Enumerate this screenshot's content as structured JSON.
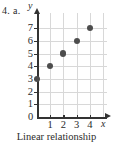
{
  "problem": {
    "label": "4. a."
  },
  "caption": {
    "text": "Linear relationship"
  },
  "chart_data": {
    "type": "scatter",
    "title": "",
    "xlabel": "x",
    "ylabel": "y",
    "x": [
      0,
      1,
      2,
      3,
      4
    ],
    "values": [
      3,
      4,
      5,
      6,
      7
    ],
    "points": [
      {
        "x": 0,
        "y": 3
      },
      {
        "x": 1,
        "y": 4
      },
      {
        "x": 2,
        "y": 5
      },
      {
        "x": 3,
        "y": 6
      },
      {
        "x": 4,
        "y": 7
      }
    ],
    "xlim": [
      0,
      5
    ],
    "ylim": [
      0,
      7.6
    ],
    "xticks": [
      1,
      2,
      3,
      4
    ],
    "xtick_labels": [
      "1",
      "2",
      "3",
      "4"
    ],
    "yticks": [
      1,
      2,
      3,
      4,
      5,
      6,
      7
    ],
    "ytick_labels": [
      "1",
      "2",
      "3",
      "4",
      "5",
      "6",
      "7"
    ],
    "origin_label": "0",
    "grid": true,
    "legend": false,
    "marker_color": "#4d4d4d",
    "grid_color": "#d8d8d8",
    "axis_color": "#333333"
  }
}
